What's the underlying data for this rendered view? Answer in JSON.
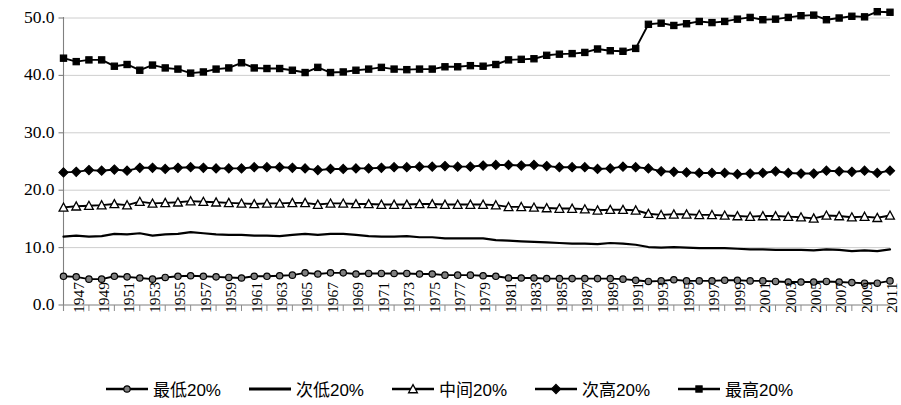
{
  "chart_data": {
    "type": "line",
    "title": "",
    "xlabel": "",
    "ylabel": "",
    "ylim": [
      0,
      50
    ],
    "yticks": [
      "0.0",
      "10.0",
      "20.0",
      "30.0",
      "40.0",
      "50.0"
    ],
    "ytick_values": [
      0,
      10,
      20,
      30,
      40,
      50
    ],
    "grid": true,
    "legend_position": "bottom",
    "x_tick_step": 2,
    "x": [
      1947,
      1948,
      1949,
      1950,
      1951,
      1952,
      1953,
      1954,
      1955,
      1956,
      1957,
      1958,
      1959,
      1960,
      1961,
      1962,
      1963,
      1964,
      1965,
      1966,
      1967,
      1968,
      1969,
      1970,
      1971,
      1972,
      1973,
      1974,
      1975,
      1976,
      1977,
      1978,
      1979,
      1980,
      1981,
      1982,
      1983,
      1984,
      1985,
      1986,
      1987,
      1988,
      1989,
      1990,
      1991,
      1992,
      1993,
      1994,
      1995,
      1996,
      1997,
      1998,
      1999,
      2000,
      2001,
      2002,
      2003,
      2004,
      2005,
      2006,
      2007,
      2008,
      2009,
      2010,
      2011,
      2012
    ],
    "xticklabels": [
      "1947",
      "1949",
      "1951",
      "1953",
      "1955",
      "1957",
      "1959",
      "1961",
      "1963",
      "1965",
      "1967",
      "1969",
      "1971",
      "1973",
      "1975",
      "1977",
      "1979",
      "1981",
      "1983",
      "1985",
      "1987",
      "1989",
      "1991",
      "1993",
      "1995",
      "1997",
      "1999",
      "2001",
      "2003",
      "2005",
      "2007",
      "2009",
      "2011"
    ],
    "series": [
      {
        "name": "最低20%",
        "marker": "circle",
        "color": "#000000",
        "marker_fill": "#808080",
        "values": [
          5.0,
          4.9,
          4.5,
          4.5,
          5.0,
          4.9,
          4.7,
          4.5,
          4.8,
          5.0,
          5.1,
          5.0,
          4.9,
          4.8,
          4.7,
          5.0,
          5.0,
          5.1,
          5.2,
          5.6,
          5.4,
          5.6,
          5.6,
          5.4,
          5.5,
          5.5,
          5.5,
          5.5,
          5.4,
          5.4,
          5.2,
          5.2,
          5.2,
          5.1,
          5.0,
          4.7,
          4.7,
          4.7,
          4.6,
          4.6,
          4.6,
          4.6,
          4.6,
          4.6,
          4.5,
          4.3,
          4.1,
          4.2,
          4.4,
          4.2,
          4.2,
          4.2,
          4.3,
          4.3,
          4.2,
          4.2,
          4.1,
          4.0,
          4.0,
          4.0,
          4.1,
          4.0,
          3.9,
          3.8,
          3.8,
          4.2
        ]
      },
      {
        "name": "次低20%",
        "marker": "none",
        "color": "#000000",
        "marker_fill": "#000000",
        "values": [
          11.9,
          12.1,
          11.9,
          12.0,
          12.4,
          12.3,
          12.5,
          12.1,
          12.3,
          12.4,
          12.7,
          12.5,
          12.3,
          12.2,
          12.2,
          12.1,
          12.1,
          12.0,
          12.2,
          12.4,
          12.2,
          12.4,
          12.4,
          12.2,
          12.0,
          11.9,
          11.9,
          12.0,
          11.8,
          11.8,
          11.6,
          11.6,
          11.6,
          11.6,
          11.3,
          11.2,
          11.1,
          11.0,
          10.9,
          10.8,
          10.7,
          10.7,
          10.6,
          10.8,
          10.7,
          10.5,
          10.1,
          10.0,
          10.1,
          10.0,
          9.9,
          9.9,
          9.9,
          9.8,
          9.7,
          9.7,
          9.6,
          9.6,
          9.6,
          9.5,
          9.7,
          9.6,
          9.4,
          9.5,
          9.4,
          9.7
        ]
      },
      {
        "name": "中间20%",
        "marker": "triangle",
        "color": "#000000",
        "marker_fill": "#ffffff",
        "values": [
          17.0,
          17.2,
          17.3,
          17.4,
          17.6,
          17.4,
          18.0,
          17.7,
          17.8,
          17.9,
          18.1,
          18.0,
          17.9,
          17.8,
          17.7,
          17.6,
          17.7,
          17.7,
          17.8,
          17.8,
          17.5,
          17.7,
          17.7,
          17.6,
          17.6,
          17.5,
          17.5,
          17.5,
          17.6,
          17.6,
          17.5,
          17.5,
          17.5,
          17.5,
          17.4,
          17.1,
          17.1,
          17.0,
          16.9,
          16.8,
          16.8,
          16.7,
          16.5,
          16.6,
          16.6,
          16.5,
          15.9,
          15.7,
          15.8,
          15.8,
          15.7,
          15.7,
          15.6,
          15.5,
          15.4,
          15.5,
          15.5,
          15.4,
          15.3,
          15.1,
          15.6,
          15.5,
          15.3,
          15.4,
          15.2,
          15.6
        ]
      },
      {
        "name": "次高20%",
        "marker": "diamond",
        "color": "#000000",
        "marker_fill": "#000000",
        "values": [
          23.1,
          23.2,
          23.5,
          23.4,
          23.6,
          23.4,
          23.9,
          23.9,
          23.7,
          23.9,
          24.0,
          23.9,
          23.8,
          23.8,
          23.8,
          24.0,
          24.0,
          24.0,
          23.9,
          23.8,
          23.5,
          23.7,
          23.7,
          23.8,
          23.8,
          23.9,
          24.0,
          24.0,
          24.1,
          24.1,
          24.2,
          24.1,
          24.1,
          24.3,
          24.4,
          24.4,
          24.3,
          24.4,
          24.2,
          24.0,
          24.0,
          24.0,
          23.7,
          23.8,
          24.1,
          24.0,
          23.8,
          23.3,
          23.2,
          23.1,
          23.0,
          23.0,
          23.0,
          22.8,
          22.9,
          23.0,
          23.3,
          23.0,
          22.9,
          22.9,
          23.4,
          23.3,
          23.2,
          23.4,
          23.0,
          23.4
        ]
      },
      {
        "name": "最高20%",
        "marker": "square",
        "color": "#000000",
        "marker_fill": "#000000",
        "values": [
          43.0,
          42.4,
          42.7,
          42.7,
          41.6,
          41.9,
          40.9,
          41.8,
          41.3,
          41.1,
          40.4,
          40.6,
          41.1,
          41.3,
          42.2,
          41.3,
          41.2,
          41.2,
          40.9,
          40.5,
          41.4,
          40.5,
          40.6,
          40.9,
          41.1,
          41.4,
          41.1,
          41.0,
          41.1,
          41.1,
          41.5,
          41.5,
          41.7,
          41.6,
          41.9,
          42.7,
          42.8,
          42.9,
          43.5,
          43.7,
          43.8,
          44.0,
          44.6,
          44.3,
          44.2,
          44.7,
          48.9,
          49.1,
          48.7,
          49.0,
          49.4,
          49.2,
          49.4,
          49.8,
          50.1,
          49.7,
          49.8,
          50.1,
          50.4,
          50.5,
          49.7,
          50.0,
          50.3,
          50.2,
          51.1,
          51.0
        ]
      }
    ]
  },
  "legend": {
    "items": [
      {
        "label": "最低20%",
        "marker": "circle"
      },
      {
        "label": "次低20%",
        "marker": "none"
      },
      {
        "label": "中间20%",
        "marker": "triangle"
      },
      {
        "label": "次高20%",
        "marker": "diamond"
      },
      {
        "label": "最高20%",
        "marker": "square"
      }
    ]
  }
}
